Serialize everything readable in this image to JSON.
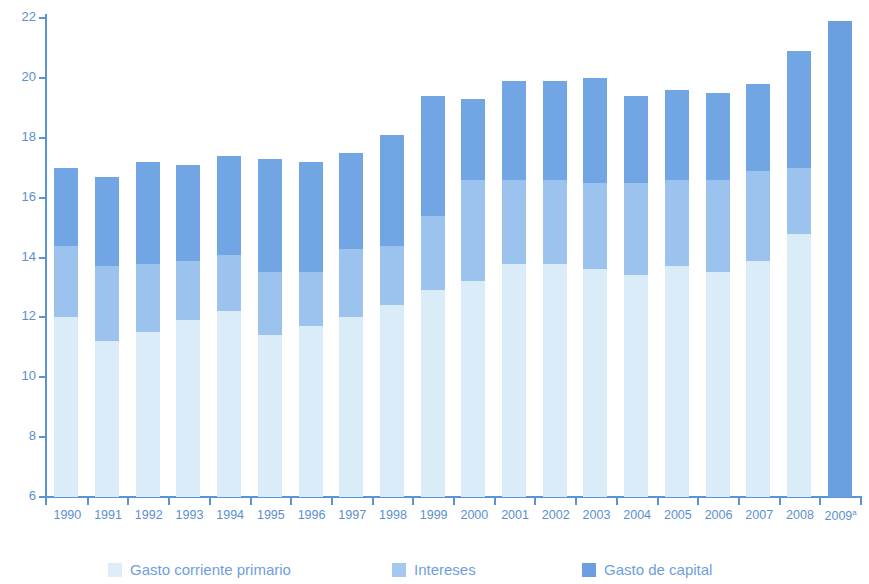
{
  "chart_data": {
    "type": "bar",
    "stacked": true,
    "title": "",
    "subtitle": "",
    "xlabel": "",
    "ylabel": "",
    "ylim": [
      6,
      22
    ],
    "ytick_step": 2,
    "yticks": [
      "6",
      "8",
      "10",
      "12",
      "14",
      "16",
      "18",
      "20",
      "22"
    ],
    "grid": false,
    "legend_position": "bottom",
    "categories": [
      "1990",
      "1991",
      "1992",
      "1993",
      "1994",
      "1995",
      "1996",
      "1997",
      "1998",
      "1999",
      "2000",
      "2001",
      "2002",
      "2003",
      "2004",
      "2005",
      "2006",
      "2007",
      "2008",
      "2009"
    ],
    "category_notes": {
      "2009": "a"
    },
    "series": [
      {
        "name": "Gasto corriente primario",
        "color": "#d9ecf8",
        "values": [
          12.0,
          11.2,
          11.5,
          11.9,
          12.2,
          11.4,
          11.7,
          12.0,
          12.4,
          12.9,
          13.2,
          13.8,
          13.8,
          13.6,
          13.4,
          13.7,
          13.5,
          13.9,
          14.8,
          null
        ]
      },
      {
        "name": "Intereses",
        "color": "#9cc3ee",
        "values": [
          2.4,
          2.5,
          2.3,
          2.0,
          1.9,
          2.1,
          1.8,
          2.3,
          2.0,
          2.5,
          3.4,
          2.8,
          2.8,
          2.9,
          3.1,
          2.9,
          3.1,
          3.0,
          2.2,
          null
        ]
      },
      {
        "name": "Gasto de capital",
        "color": "#71a5e4",
        "values": [
          2.6,
          3.0,
          3.4,
          3.2,
          3.3,
          3.8,
          3.7,
          3.2,
          3.7,
          4.0,
          2.7,
          3.3,
          3.3,
          3.5,
          2.9,
          3.0,
          2.9,
          2.9,
          3.9,
          null
        ]
      }
    ],
    "totals": [
      17.0,
      16.7,
      17.2,
      17.1,
      17.4,
      17.3,
      17.2,
      17.5,
      18.1,
      19.4,
      19.3,
      19.9,
      19.9,
      20.0,
      19.4,
      19.6,
      19.5,
      19.8,
      20.9,
      21.9
    ],
    "projection": {
      "category": "2009",
      "value": 21.9,
      "color": "#6c9fe0",
      "segmented": false
    },
    "legend": [
      {
        "label": "Gasto corriente primario",
        "swatch": "sw-primario"
      },
      {
        "label": "Intereses",
        "swatch": "sw-intereses"
      },
      {
        "label": "Gasto de capital",
        "swatch": "sw-capital"
      }
    ]
  },
  "colors": {
    "axis": "#5b93d6",
    "tick_text": "#5b8fd0",
    "legend_text": "#6f9ede",
    "primario": "#d9ecf8",
    "intereses": "#9cc3ee",
    "capital": "#71a5e4",
    "projection": "#6c9fe0",
    "background": "#ffffff"
  },
  "legend_labels": {
    "primario": "Gasto corriente primario",
    "intereses": "Intereses",
    "capital": "Gasto de capital"
  },
  "axis": {
    "y_min_label": "6",
    "y_max_label": "22"
  }
}
